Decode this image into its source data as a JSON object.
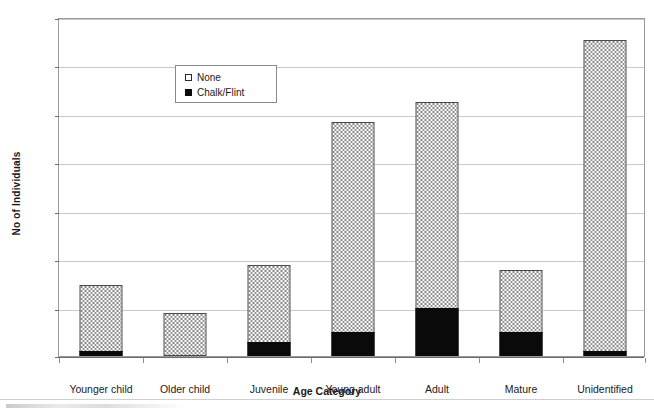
{
  "chart_data": {
    "type": "bar",
    "stacked": true,
    "title": "",
    "xlabel": "Age Category",
    "ylabel": "No of Individuals",
    "ylim": [
      0,
      70
    ],
    "ytick_step": 10,
    "yticks": [
      0,
      10,
      20,
      30,
      40,
      50,
      60,
      70
    ],
    "grid": true,
    "legend_position": "upper-left-inside",
    "categories": [
      "Younger child",
      "Older child",
      "Juvenile",
      "Young adult",
      "Adult",
      "Mature",
      "Unidentified"
    ],
    "series": [
      {
        "name": "Chalk/Flint",
        "fill": "solid-black",
        "color": "#0a0a0a",
        "values": [
          1,
          0,
          3,
          5,
          10,
          5,
          1
        ]
      },
      {
        "name": "None",
        "fill": "dotted-white",
        "color": "#fdfdfd",
        "values": [
          14,
          9,
          16,
          43.7,
          42.8,
          13,
          64.7
        ]
      }
    ],
    "totals": [
      15,
      9,
      19,
      48.7,
      52.8,
      18,
      65.7
    ]
  },
  "axes": {
    "y_title": "No of Individuals",
    "x_title": "Age Category",
    "y_tick_labels": [
      "70",
      "60",
      "50",
      "40",
      "30",
      "20",
      "10",
      "0"
    ],
    "x_tick_labels": [
      "Younger child",
      "Older child",
      "Juvenile",
      "Young adult",
      "Adult",
      "Mature",
      "Unidentified"
    ]
  },
  "legend": {
    "items": [
      {
        "label": "None",
        "swatch": "open-dotted-square"
      },
      {
        "label": "Chalk/Flint",
        "swatch": "filled-black-square"
      }
    ]
  },
  "colors": {
    "chalk_flint": "#0a0a0a",
    "none_fill": "#fdfdfd",
    "gridline": "#c8c8c8",
    "axis": "#6b6b6b",
    "frame": "#9a9a9a"
  }
}
